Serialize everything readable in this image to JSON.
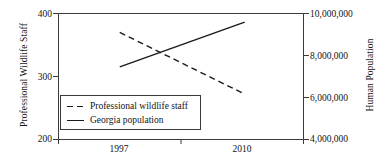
{
  "chart_data": {
    "type": "line",
    "title": "",
    "xlabel": "",
    "grid": false,
    "legend_position": "inside-bottom-left",
    "x": [
      1997,
      2010
    ],
    "x_ticks": [
      "1997",
      "2010"
    ],
    "axes": {
      "left": {
        "label": "Professional Wildlife Staff",
        "ticks": [
          "400",
          "300",
          "200"
        ],
        "tick_values": [
          400,
          300,
          200
        ],
        "min": 200,
        "max": 400
      },
      "right": {
        "label": "Human Population",
        "ticks": [
          "10,000,000",
          "8,000,000",
          "6,000,000",
          "4,000,000"
        ],
        "tick_values": [
          10000000,
          8000000,
          6000000,
          4000000
        ],
        "min": 4000000,
        "max": 10000000
      }
    },
    "series": [
      {
        "name": "Professional wildlife staff",
        "legend_label": "Professional wildlife staff",
        "style": "dashed",
        "axis": "left",
        "color": "#1a1a1a",
        "values": [
          370,
          272
        ]
      },
      {
        "name": "Georgia population",
        "legend_label": "Georgia population",
        "style": "solid",
        "axis": "right",
        "color": "#1a1a1a",
        "values": [
          7460000,
          9590000
        ]
      }
    ]
  },
  "plot": {
    "frame_color": "#3a3a3a"
  }
}
